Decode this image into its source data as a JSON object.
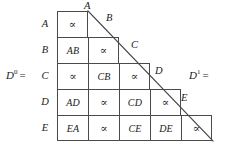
{
  "figure": {
    "left_equation": {
      "base": "D",
      "exponent": "0",
      "equals": "="
    },
    "right_equation": {
      "base": "D",
      "exponent": "1",
      "equals": "="
    },
    "row_labels": [
      "A",
      "B",
      "C",
      "D",
      "E"
    ],
    "diagonal_labels": [
      "A",
      "B",
      "C",
      "D",
      "E"
    ],
    "proportional_symbol": "∝",
    "rows": [
      {
        "label": "A",
        "cells": [
          "∝"
        ]
      },
      {
        "label": "B",
        "cells": [
          "AB",
          "∝"
        ]
      },
      {
        "label": "C",
        "cells": [
          "∝",
          "CB",
          "∝"
        ]
      },
      {
        "label": "D",
        "cells": [
          "AD",
          "∝",
          "CD",
          "∝"
        ]
      },
      {
        "label": "E",
        "cells": [
          "EA",
          "∝",
          "CE",
          "DE",
          "∝"
        ]
      }
    ],
    "colors": {
      "line": "#4a4a4a",
      "text": "#1a1a1a",
      "background": "#ffffff"
    }
  }
}
